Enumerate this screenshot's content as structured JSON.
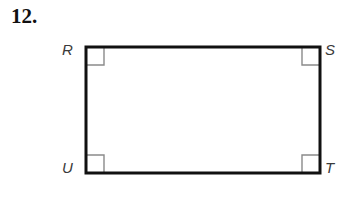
{
  "problem": {
    "number": "12.",
    "type": "geometry-figure"
  },
  "figure": {
    "shape_name": "rectangle",
    "stroke_color": "#111111",
    "stroke_width": 3,
    "angle_mark_color": "#8a8a8a",
    "angle_mark_width": 1,
    "angle_mark_size": 18,
    "fill_color": "#ffffff",
    "bounds": {
      "left": 86,
      "top": 47,
      "right": 320,
      "bottom": 173,
      "width": 234,
      "height": 126
    },
    "vertices": [
      {
        "id": "R",
        "label": "R",
        "position": "top-left",
        "x": 86,
        "y": 47
      },
      {
        "id": "S",
        "label": "S",
        "position": "top-right",
        "x": 320,
        "y": 47
      },
      {
        "id": "T",
        "label": "T",
        "position": "bottom-right",
        "x": 320,
        "y": 173
      },
      {
        "id": "U",
        "label": "U",
        "position": "bottom-left",
        "x": 86,
        "y": 173
      }
    ],
    "right_angle_marks": [
      {
        "at_vertex": "R",
        "label": "right-angle-mark-R"
      },
      {
        "at_vertex": "S",
        "label": "right-angle-mark-S"
      },
      {
        "at_vertex": "T",
        "label": "right-angle-mark-T"
      },
      {
        "at_vertex": "U",
        "label": "right-angle-mark-U"
      }
    ]
  },
  "canvas": {
    "background": "#ffffff",
    "width": 354,
    "height": 203
  }
}
